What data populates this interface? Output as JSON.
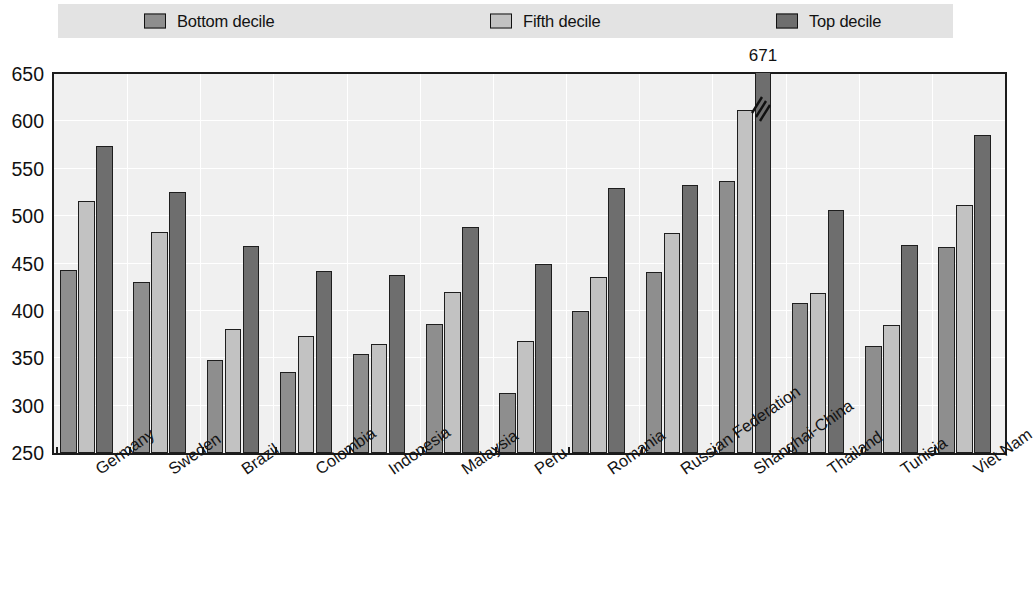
{
  "legend": {
    "position": "top",
    "items": [
      {
        "label": "Bottom decile",
        "color": "#8e8e8e",
        "icon": "legend-swatch"
      },
      {
        "label": "Fifth decile",
        "color": "#c2c2c2",
        "icon": "legend-swatch"
      },
      {
        "label": "Top decile",
        "color": "#6e6e6e",
        "icon": "legend-swatch"
      }
    ]
  },
  "chart_data": {
    "type": "bar",
    "title": "",
    "subtitle": "",
    "xlabel": "",
    "ylabel": "",
    "ylim": [
      250,
      650
    ],
    "yticks": [
      250,
      300,
      350,
      400,
      450,
      500,
      550,
      600,
      650
    ],
    "grid": true,
    "legend_position": "top",
    "categories": [
      "Germany",
      "Sweden",
      "Brazil",
      "Colombia",
      "Indonesia",
      "Malaysia",
      "Peru",
      "Romania",
      "Russian Federation",
      "Shanghai-China",
      "Thailand",
      "Tunisia",
      "Viet Nam"
    ],
    "series": [
      {
        "name": "Bottom decile",
        "color": "#8e8e8e",
        "values": [
          443,
          430,
          348,
          335,
          355,
          386,
          313,
          400,
          441,
          537,
          408,
          363,
          467
        ]
      },
      {
        "name": "Fifth decile",
        "color": "#c2c2c2",
        "values": [
          516,
          483,
          381,
          374,
          365,
          420,
          368,
          436,
          482,
          612,
          419,
          385,
          512
        ]
      },
      {
        "name": "Top decile",
        "color": "#6e6e6e",
        "values": [
          574,
          525,
          469,
          442,
          438,
          489,
          449,
          530,
          533,
          671,
          507,
          470,
          586
        ]
      }
    ],
    "annotations": [
      {
        "category": "Shanghai-China",
        "series": "Top decile",
        "label": "671",
        "note": "bar clipped at axis maximum, drawn with axis-break zigzag"
      }
    ]
  }
}
